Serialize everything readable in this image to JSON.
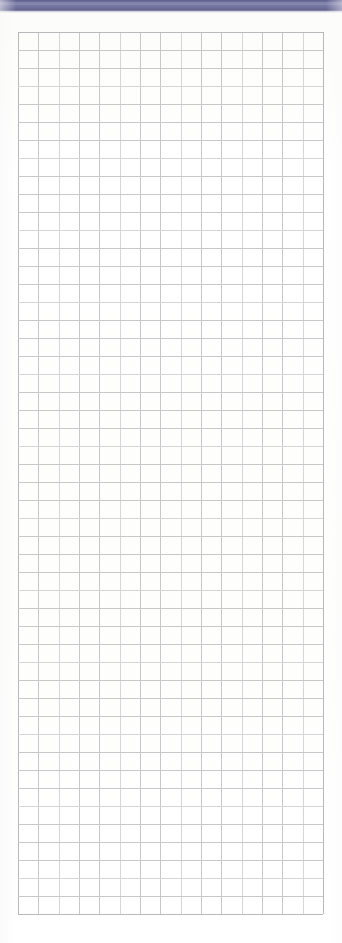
{
  "document": {
    "kind": "scanned-grid-paper",
    "page_width": 342,
    "page_height": 943,
    "background_color": "#ffffff",
    "caption": ""
  },
  "top_band": {
    "name": "scanner-edge-band",
    "color": "#6f6f9e",
    "highlight_color": "#7a7aa7",
    "shadow_color": "#5d5d8e",
    "x": 0,
    "y": 0,
    "width": 342,
    "height": 11,
    "label": ""
  },
  "grid": {
    "name": "graph-paper-grid",
    "x": 18,
    "y": 32,
    "width": 305,
    "height": 882,
    "columns": 15,
    "rows": 49,
    "cell_width": 20.33,
    "cell_height": 18.0,
    "line_color": "#c8c8ca",
    "line_color_faint": "#d6d6d8",
    "line_color_edge": "#b9b9bd",
    "line_width": 1,
    "content": ""
  },
  "annotations": {
    "text_on_page": "",
    "marks": []
  }
}
